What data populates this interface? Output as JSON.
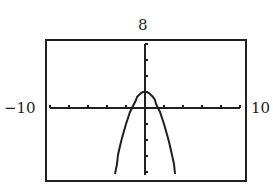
{
  "window_labels": {
    "ymax": "8",
    "xmin": "−10",
    "xmax": "10"
  },
  "colors": {
    "ink": "#231f20",
    "background": "#ffffff"
  },
  "chart_data": {
    "type": "line",
    "title": "",
    "xlabel": "",
    "ylabel": "",
    "function": "y = 2 - x^2",
    "xlim": [
      -10,
      10
    ],
    "ylim": [
      -8,
      8
    ],
    "x_tick_step": 2,
    "y_tick_step": 2,
    "grid": false,
    "axis_labels_shown": {
      "ymax": "8",
      "xmin": "-10",
      "xmax": "10"
    },
    "vertex": [
      0,
      2
    ],
    "x_intercepts": [
      -1.41,
      1.41
    ],
    "series": [
      {
        "name": "parabola",
        "style": "pixelated-line",
        "x": [
          -3.2,
          -3.0,
          -2.8,
          -2.6,
          -2.4,
          -2.2,
          -2.0,
          -1.8,
          -1.6,
          -1.4,
          -1.2,
          -1.0,
          -0.8,
          -0.6,
          -0.4,
          -0.2,
          0.0,
          0.2,
          0.4,
          0.6,
          0.8,
          1.0,
          1.2,
          1.4,
          1.6,
          1.8,
          2.0,
          2.2,
          2.4,
          2.6,
          2.8,
          3.0,
          3.2
        ],
        "y": [
          -8.24,
          -7.0,
          -5.84,
          -4.76,
          -3.76,
          -2.84,
          -2.0,
          -1.24,
          -0.56,
          0.04,
          0.56,
          1.0,
          1.36,
          1.64,
          1.84,
          1.96,
          2.0,
          1.96,
          1.84,
          1.64,
          1.36,
          1.0,
          0.56,
          0.04,
          -0.56,
          -1.24,
          -2.0,
          -2.84,
          -3.76,
          -4.76,
          -5.84,
          -7.0,
          -8.24
        ]
      }
    ]
  },
  "geometry": {
    "frame": {
      "x": 46,
      "y": 40,
      "w": 200,
      "h": 141
    },
    "origin_px": [
      145,
      108
    ],
    "px_per_unit_x": 9.5,
    "px_per_unit_y": 8.0,
    "x_axis_px": [
      50,
      240
    ],
    "y_axis_px": [
      44,
      175
    ]
  }
}
